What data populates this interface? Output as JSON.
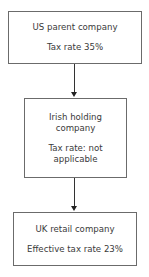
{
  "nodes": [
    {
      "title": "US parent company",
      "detail": "Tax rate 35%"
    },
    {
      "title_line1": "Irish holding",
      "title_line2": "company",
      "detail_line1": "Tax rate: not",
      "detail_line2": "applicable"
    },
    {
      "title": "UK retail company",
      "detail": "Effective tax rate 23%"
    }
  ],
  "edges": [
    {
      "from": "US parent company",
      "to": "Irish holding company"
    },
    {
      "from": "Irish holding company",
      "to": "UK retail company"
    }
  ],
  "colors": {
    "border": "#6b6b6b",
    "arrow": "#222222",
    "text": "#3a3a3a"
  }
}
